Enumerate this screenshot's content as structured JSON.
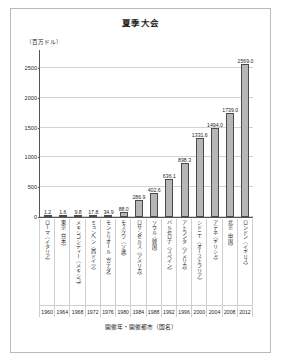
{
  "chart_data": {
    "type": "bar",
    "title": "夏季大会",
    "ylabel": "（百万ドル）",
    "xlabel": "開催年・開催都市（国名）",
    "ylim": [
      0,
      2800
    ],
    "yticks": [
      0,
      500,
      1000,
      1500,
      2000,
      2500
    ],
    "ytick_labels": [
      "0",
      "500",
      "1000",
      "1500",
      "2000",
      "2500"
    ],
    "grid": true,
    "legend": "none",
    "categories": [
      "ローマ（イタリア）",
      "東京（日本）",
      "メキシコシティー（メキシコ）",
      "ミュンヘン（西ドイツ）",
      "モントリオール（カナダ）",
      "モスクワ（ソ連）",
      "ロサンゼルス（アメリカ）",
      "ソウル（韓国）",
      "バルセロナ（スペイン）",
      "アトランタ（アメリカ）",
      "シドニー（オーストラリア）",
      "アテネ（ギリシャ）",
      "北京（中国）",
      "ロンドン（イギリス）"
    ],
    "x": [
      1960,
      1964,
      1968,
      1972,
      1976,
      1980,
      1984,
      1988,
      1992,
      1996,
      2000,
      2004,
      2008,
      2012
    ],
    "xtick_labels": [
      "1960",
      "1964",
      "1968",
      "1972",
      "1976",
      "1980",
      "1984",
      "1988",
      "1992",
      "1996",
      "2000",
      "2004",
      "2008",
      "2012"
    ],
    "values": [
      1.2,
      1.6,
      9.8,
      17.8,
      34.9,
      88.0,
      286.9,
      402.6,
      636.1,
      898.3,
      1331.6,
      1494.0,
      1739.0,
      2569.0
    ],
    "value_labels": [
      "1.2",
      "1.6",
      "9.8",
      "17.8",
      "34.9",
      "88.0",
      "286.9",
      "402.6",
      "636.1",
      "898.3",
      "1331.6",
      "1494.0",
      "1739.0",
      "2569.0"
    ],
    "bar_color": "#b6b6b6",
    "bar_edge_color": "#4a4a4a"
  }
}
